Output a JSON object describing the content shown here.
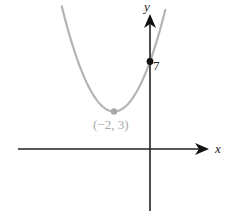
{
  "chart_data": {
    "type": "line",
    "title": "",
    "xlabel": "x",
    "ylabel": "y",
    "function": "y = (x + 2)^2 + 3",
    "series": [
      {
        "name": "parabola",
        "color": "#b0b0b0",
        "x": [
          -4.6,
          -4,
          -3.5,
          -3,
          -2.5,
          -2,
          -1.5,
          -1,
          -0.5,
          0,
          0.5,
          0.8
        ],
        "values": [
          9.76,
          7,
          5.25,
          4,
          3.25,
          3,
          3.25,
          4,
          5.25,
          7,
          9.25,
          10.84
        ]
      }
    ],
    "points": [
      {
        "name": "vertex",
        "x": -2,
        "y": 3,
        "label": "(−2, 3)",
        "color": "#a8a8a8"
      },
      {
        "name": "y-intercept",
        "x": 0,
        "y": 7,
        "label": "7",
        "color": "#111111"
      }
    ],
    "grid": false,
    "legend": null,
    "axes": {
      "x_arrow": true,
      "y_arrow": true
    }
  },
  "labels": {
    "x_axis": "x",
    "y_axis": "y",
    "vertex": "(−2, 3)",
    "intercept": "7"
  }
}
